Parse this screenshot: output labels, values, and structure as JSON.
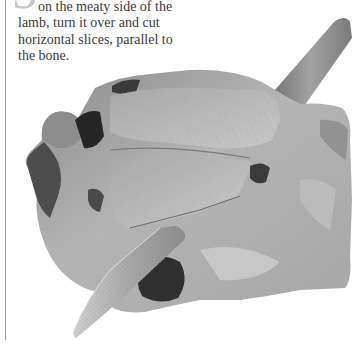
{
  "step": {
    "number": "5",
    "text_first_line": "on the meaty side of the",
    "text_rest": "lamb, turn it over and cut horizontal slices, parallel to the bone."
  },
  "photo": {
    "subject": "carved lamb joint with knife",
    "colors": {
      "meat_light": "#bdbdbd",
      "meat_mid": "#9c9c9c",
      "meat_dark": "#5a5a5a",
      "crust": "#2e2e2e",
      "knife_handle": "#8e8e8e",
      "blade": "#b8b8b8"
    }
  }
}
